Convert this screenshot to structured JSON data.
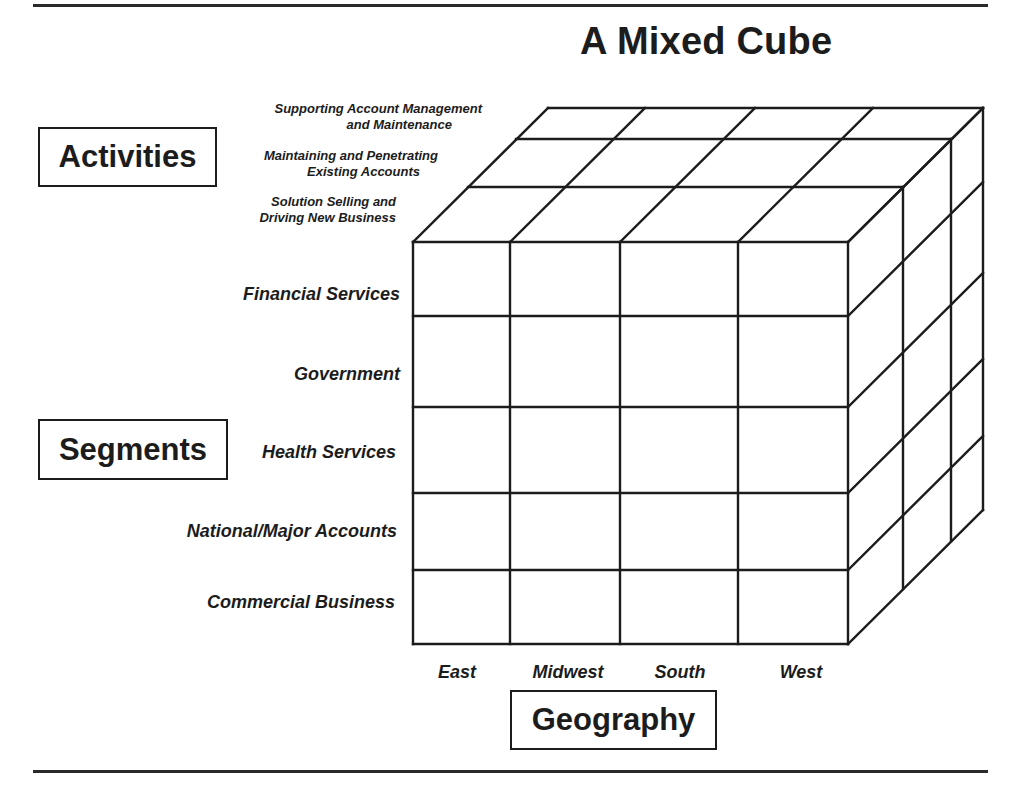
{
  "title": "A Mixed Cube",
  "dimensions": {
    "activities": {
      "label": "Activities",
      "items": [
        {
          "line1": "Supporting Account Management",
          "line2": "and Maintenance"
        },
        {
          "line1": "Maintaining and Penetrating",
          "line2": "Existing Accounts"
        },
        {
          "line1": "Solution Selling and",
          "line2": "Driving New Business"
        }
      ]
    },
    "segments": {
      "label": "Segments",
      "items": [
        "Financial Services",
        "Government",
        "Health Services",
        "National/Major Accounts",
        "Commercial Business"
      ]
    },
    "geography": {
      "label": "Geography",
      "items": [
        "East",
        "Midwest",
        "South",
        "West"
      ]
    }
  },
  "cube_geometry": {
    "front_x": [
      413,
      510,
      620,
      738,
      848
    ],
    "front_y": [
      242,
      316,
      407,
      493,
      570,
      644
    ],
    "depth_offsets": [
      [
        0,
        0
      ],
      [
        55,
        -55
      ],
      [
        103,
        -103
      ],
      [
        135,
        -134
      ]
    ],
    "line_color": "#1c1c1c"
  }
}
